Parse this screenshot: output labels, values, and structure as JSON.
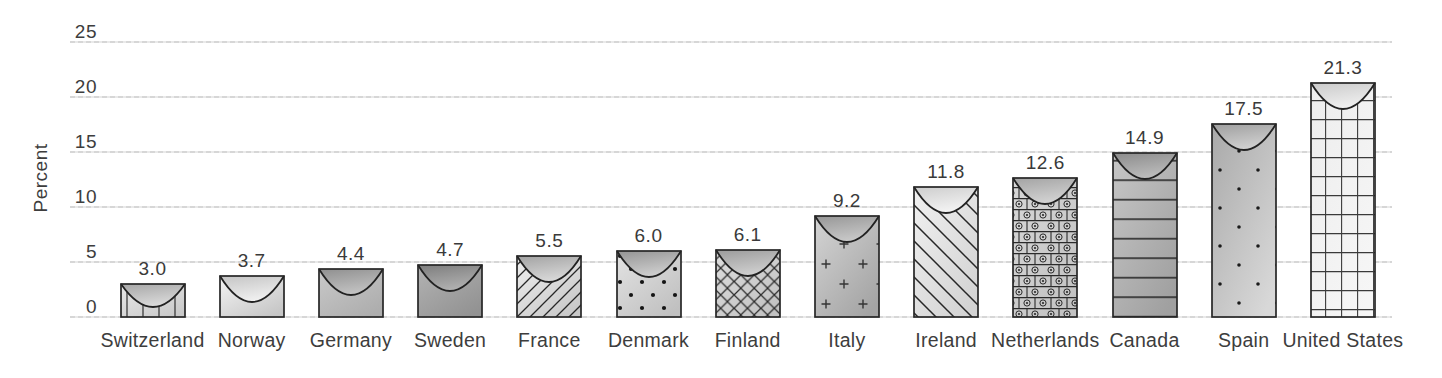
{
  "chart_data": {
    "type": "bar",
    "title": "",
    "xlabel": "",
    "ylabel": "Percent",
    "ylim": [
      0,
      25
    ],
    "yticks": [
      0,
      5,
      10,
      15,
      20,
      25
    ],
    "grid": "horizontal",
    "legend": "none",
    "categories": [
      "Switzerland",
      "Norway",
      "Germany",
      "Sweden",
      "France",
      "Denmark",
      "Finland",
      "Italy",
      "Ireland",
      "Netherlands",
      "Canada",
      "Spain",
      "United States"
    ],
    "values": [
      3.0,
      3.7,
      4.4,
      4.7,
      5.5,
      6.0,
      6.1,
      9.2,
      11.8,
      12.6,
      14.9,
      17.5,
      21.3
    ],
    "bars": [
      {
        "label": "Switzerland",
        "value": 3.0,
        "display": "3.0",
        "pattern": "vertical-lines",
        "body": [
          "#e9e9e9",
          "#c9c9c9"
        ],
        "cap": [
          "#a6a6a6",
          "#dadada"
        ]
      },
      {
        "label": "Norway",
        "value": 3.7,
        "display": "3.7",
        "pattern": "none",
        "body": [
          "#f5f5f5",
          "#c6c6c6"
        ],
        "cap": [
          "#c4c4c4",
          "#f0f0f0"
        ]
      },
      {
        "label": "Germany",
        "value": 4.4,
        "display": "4.4",
        "pattern": "none",
        "body": [
          "#c9c9c9",
          "#adadad"
        ],
        "cap": [
          "#8f8f8f",
          "#c2c2c2"
        ]
      },
      {
        "label": "Sweden",
        "value": 4.7,
        "display": "4.7",
        "pattern": "none",
        "body": [
          "#b3b3b3",
          "#929292"
        ],
        "cap": [
          "#7d7d7d",
          "#b0b0b0"
        ]
      },
      {
        "label": "France",
        "value": 5.5,
        "display": "5.5",
        "pattern": "diagonal-forward",
        "body": [
          "#efefef",
          "#c8c8c8"
        ],
        "cap": [
          "#a2a2a2",
          "#d8d8d8"
        ]
      },
      {
        "label": "Denmark",
        "value": 6.0,
        "display": "6.0",
        "pattern": "dots",
        "body": [
          "#e3e3e3",
          "#c0c0c0"
        ],
        "cap": [
          "#949494",
          "#cecece"
        ]
      },
      {
        "label": "Finland",
        "value": 6.1,
        "display": "6.1",
        "pattern": "diamond-crosshatch",
        "body": [
          "#dedede",
          "#c2c2c2"
        ],
        "cap": [
          "#9b9b9b",
          "#cfcfcf"
        ]
      },
      {
        "label": "Italy",
        "value": 9.2,
        "display": "9.2",
        "pattern": "plus-signs",
        "body": [
          "#d4d4d4",
          "#a4a4a4"
        ],
        "cap": [
          "#969696",
          "#c8c8c8"
        ]
      },
      {
        "label": "Ireland",
        "value": 11.8,
        "display": "11.8",
        "pattern": "diagonal-back",
        "body": [
          "#f1f1f1",
          "#d3d3d3"
        ],
        "cap": [
          "#cdcdcd",
          "#f3f3f3"
        ]
      },
      {
        "label": "Netherlands",
        "value": 12.6,
        "display": "12.6",
        "pattern": "brick-circle-dot",
        "body": [
          "#d8d8d8",
          "#c2c2c2"
        ],
        "cap": [
          "#a3a3a3",
          "#d2d2d2"
        ]
      },
      {
        "label": "Canada",
        "value": 14.9,
        "display": "14.9",
        "pattern": "horizontal-lines",
        "body": [
          "#c6c6c6",
          "#a0a0a0"
        ],
        "cap": [
          "#8b8b8b",
          "#bcbcbc"
        ]
      },
      {
        "label": "Spain",
        "value": 17.5,
        "display": "17.5",
        "pattern": "sparse-dots",
        "body": [
          "#a9a9a9",
          "#d8d8d8"
        ],
        "cap": [
          "#9e9e9e",
          "#d0d0d0"
        ]
      },
      {
        "label": "United States",
        "value": 21.3,
        "display": "21.3",
        "pattern": "grid",
        "body": [
          "#ededed",
          "#f6f6f6"
        ],
        "cap": [
          "#cacaca",
          "#efefef"
        ]
      }
    ],
    "colors": {
      "text": "#3d3d3d",
      "gridline": "#d9d9d9",
      "bar_outline": "#262626",
      "background": "#ffffff"
    }
  }
}
